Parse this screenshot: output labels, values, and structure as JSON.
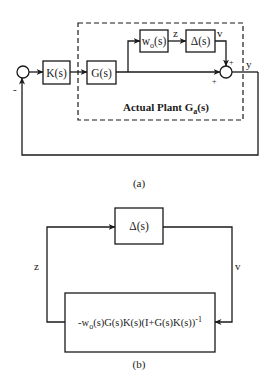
{
  "figure_a": {
    "caption": "(a)",
    "blocks": {
      "controller": "K(s)",
      "plant": "G(s)",
      "weight_main": "w",
      "weight_sub": "o",
      "weight_tail": "(s)",
      "uncertainty": "Δ(s)"
    },
    "signals": {
      "z": "z",
      "v": "v",
      "y": "y"
    },
    "signs": {
      "feedback": "-",
      "sum_top": "+",
      "sum_left": "+"
    },
    "plant_label_main": "Actual Plant G",
    "plant_label_sub": "a",
    "plant_label_tail": "(s)"
  },
  "figure_b": {
    "caption": "(b)",
    "blocks": {
      "uncertainty": "Δ(s)",
      "closed_loop_pre": "-w",
      "closed_loop_sub": "o",
      "closed_loop_mid": "(s)G(s)K(s)(I+G(s)K(s))",
      "closed_loop_sup": "-1"
    },
    "signals": {
      "z": "z",
      "v": "v"
    }
  },
  "colors": {
    "ink": "#1a1a1a",
    "background": "#ffffff"
  }
}
